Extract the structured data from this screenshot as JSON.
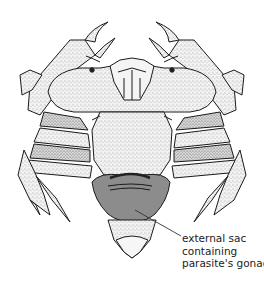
{
  "figure": {
    "colors": {
      "background": "#ffffff",
      "line": "#1a1a1a",
      "stipple_fill": "#e6e6e6",
      "sac_fill": "#8c8c8c",
      "dark_band": "#555555"
    },
    "annotation": {
      "lines": [
        "external sac",
        "containing",
        "parasite's gonad"
      ],
      "pointer": {
        "from": [
          181,
          236
        ],
        "to": [
          135,
          210
        ]
      }
    }
  }
}
